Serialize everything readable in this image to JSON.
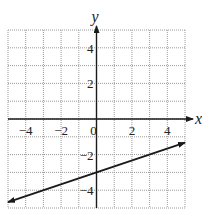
{
  "chart_data": {
    "type": "line",
    "title": "",
    "xlabel": "x",
    "ylabel": "y",
    "xlim": [
      -5,
      5
    ],
    "ylim": [
      -5,
      5
    ],
    "grid": true,
    "grid_style": "dotted",
    "x_ticks": [
      -4,
      -2,
      0,
      2,
      4
    ],
    "x_tick_labels": [
      "−4",
      "−2",
      "0",
      "2",
      "4"
    ],
    "y_ticks": [
      4,
      2,
      -2,
      -4
    ],
    "y_tick_labels": [
      "4",
      "2",
      "−2",
      "−4"
    ],
    "series": [
      {
        "name": "line",
        "equation": "y = (1/3)x - 3",
        "slope": 0.3333,
        "intercept": -3,
        "arrows": "both",
        "points": [
          {
            "x": -5,
            "y": -4.67
          },
          {
            "x": 0,
            "y": -3
          },
          {
            "x": 5,
            "y": -1.33
          }
        ]
      }
    ],
    "colors": {
      "line": "#1a1a1a",
      "axis": "#1a1a1a",
      "grid": "#9a9a9a"
    }
  }
}
